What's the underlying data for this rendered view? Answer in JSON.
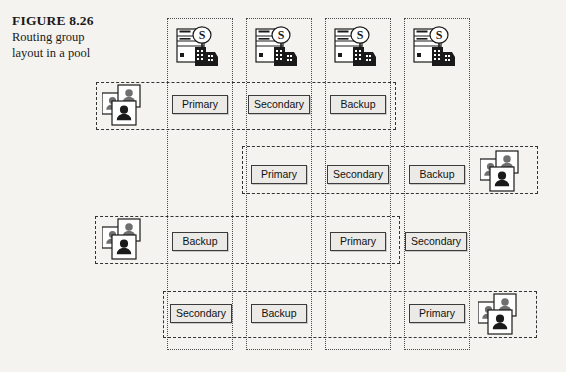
{
  "caption": {
    "figure_label": "FIGURE 8.26",
    "figure_label_prefix": "F",
    "figure_label_rest": "IGURE",
    "figure_number": " 8.26",
    "description_line1": "Routing group",
    "description_line2": "layout in a pool"
  },
  "colors": {
    "background": "#f4f3f0",
    "column_border": "#4a4a4a",
    "row_border": "#333333",
    "box_border": "#3b3b3b",
    "box_fill": "#eceae6",
    "text": "#111111",
    "icon_dark": "#1a1a1a",
    "icon_gray": "#6f6f6f"
  },
  "servers": [
    {
      "name": "server-1",
      "icon": "server-icon",
      "badge": "S"
    },
    {
      "name": "server-2",
      "icon": "server-icon",
      "badge": "S"
    },
    {
      "name": "server-3",
      "icon": "server-icon",
      "badge": "S"
    },
    {
      "name": "server-4",
      "icon": "server-icon",
      "badge": "S"
    }
  ],
  "columns": [
    {
      "name": "server-column-1",
      "x": 167,
      "y": 18,
      "w": 66,
      "h": 332
    },
    {
      "name": "server-column-2",
      "x": 246,
      "y": 18,
      "w": 66,
      "h": 332
    },
    {
      "name": "server-column-3",
      "x": 325,
      "y": 18,
      "w": 66,
      "h": 332
    },
    {
      "name": "server-column-4",
      "x": 404,
      "y": 18,
      "w": 66,
      "h": 332
    }
  ],
  "routing_groups": [
    {
      "name": "routing-group-1",
      "users_side": "left",
      "box": {
        "x": 96,
        "y": 82,
        "w": 300,
        "h": 48
      },
      "users": {
        "x": 102,
        "y": 84,
        "label": "users-icon"
      },
      "roles": [
        {
          "label": "Primary",
          "x": 172,
          "y": 95,
          "w": 56
        },
        {
          "label": "Secondary",
          "x": 248,
          "y": 95,
          "w": 62
        },
        {
          "label": "Backup",
          "x": 330,
          "y": 95,
          "w": 56
        }
      ]
    },
    {
      "name": "routing-group-2",
      "users_side": "right",
      "box": {
        "x": 242,
        "y": 146,
        "w": 296,
        "h": 48
      },
      "users": {
        "x": 480,
        "y": 150,
        "label": "users-icon"
      },
      "roles": [
        {
          "label": "Primary",
          "x": 251,
          "y": 165,
          "w": 56
        },
        {
          "label": "Secondary",
          "x": 327,
          "y": 165,
          "w": 62
        },
        {
          "label": "Backup",
          "x": 409,
          "y": 165,
          "w": 56
        }
      ]
    },
    {
      "name": "routing-group-3",
      "users_side": "left",
      "box": {
        "x": 95,
        "y": 216,
        "w": 305,
        "h": 48
      },
      "users": {
        "x": 102,
        "y": 218,
        "label": "users-icon"
      },
      "roles": [
        {
          "label": "Backup",
          "x": 172,
          "y": 232,
          "w": 56
        },
        {
          "label": "Primary",
          "x": 330,
          "y": 232,
          "w": 56
        },
        {
          "label": "Secondary",
          "x": 405,
          "y": 232,
          "w": 62
        }
      ]
    },
    {
      "name": "routing-group-4",
      "users_side": "right",
      "box": {
        "x": 163,
        "y": 291,
        "w": 374,
        "h": 47
      },
      "users": {
        "x": 478,
        "y": 293,
        "label": "users-icon"
      },
      "roles": [
        {
          "label": "Secondary",
          "x": 170,
          "y": 304,
          "w": 62
        },
        {
          "label": "Backup",
          "x": 251,
          "y": 304,
          "w": 56
        },
        {
          "label": "Primary",
          "x": 409,
          "y": 304,
          "w": 56
        }
      ]
    }
  ],
  "server_positions": [
    {
      "x": 175,
      "y": 25
    },
    {
      "x": 254,
      "y": 25
    },
    {
      "x": 333,
      "y": 25
    },
    {
      "x": 412,
      "y": 25
    }
  ]
}
